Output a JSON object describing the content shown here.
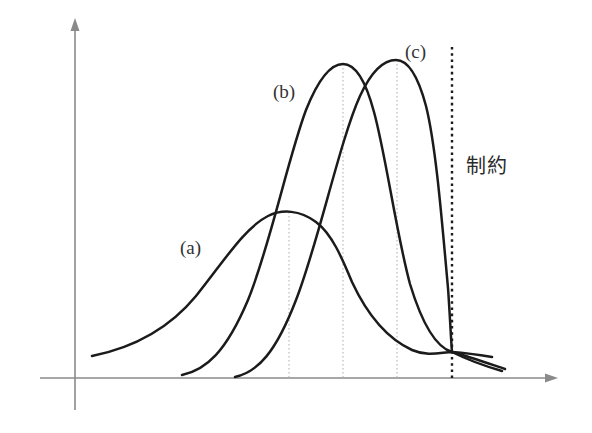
{
  "figure": {
    "title": "",
    "background_color": "#ffffff",
    "curve_color": "#1b1b1b",
    "axis_color": "#8a8a8a",
    "guide_color": "#b4b4b4"
  },
  "labels": {
    "curve_a": "(a)",
    "curve_b": "(b)",
    "curve_c": "(c)",
    "constraint": "制約"
  },
  "axes": {
    "x_axis_name": "x-axis-arrow",
    "y_axis_name": "y-axis-arrow",
    "x_axis_y": 378,
    "y_axis_x": 75
  },
  "chart_data": {
    "type": "line",
    "title": "",
    "xlabel": "",
    "ylabel": "",
    "grid": true,
    "legend_position": "inline-annotations",
    "annotations": [
      {
        "text": "(a)",
        "x": 180,
        "y": 238
      },
      {
        "text": "(b)",
        "x": 273,
        "y": 82
      },
      {
        "text": "(c)",
        "x": 405,
        "y": 42
      },
      {
        "text": "制約",
        "x": 466,
        "y": 156
      }
    ],
    "guide_lines": [
      {
        "name": "peak-a-guide",
        "x": 289,
        "style": "dotted"
      },
      {
        "name": "peak-b-guide",
        "x": 343,
        "style": "dotted"
      },
      {
        "name": "peak-c-guide",
        "x": 397,
        "style": "dotted"
      },
      {
        "name": "constraint-line",
        "x": 452,
        "style": "dashed-bold"
      }
    ],
    "series": [
      {
        "name": "(a)",
        "peak_x": 289,
        "peak_y": 212,
        "start_x": 92,
        "start_y": 356,
        "end_x": 492,
        "end_y": 357,
        "path": "M92,356 C132,348 168,330 196,296 C222,264 244,228 268,216 C282,209 300,210 316,222 C332,234 342,258 352,282 C366,312 386,338 412,350 C428,357 442,352 452,352 C466,353 480,355 492,357"
      },
      {
        "name": "(b)",
        "peak_x": 343,
        "peak_y": 64,
        "start_x": 182,
        "start_y": 375,
        "end_x": 505,
        "end_y": 369,
        "path": "M182,375 C206,370 226,352 248,300 C270,246 288,158 306,110 C318,80 330,64 343,64 C356,64 366,82 374,112 C386,156 396,232 410,284 C424,330 438,348 452,352 C470,357 490,364 505,369"
      },
      {
        "name": "(c)",
        "peak_x": 396,
        "peak_y": 60,
        "start_x": 235,
        "start_y": 377,
        "end_x": 502,
        "end_y": 371,
        "path": "M235,377 C258,372 276,352 296,300 C318,244 340,140 360,96 C372,70 384,60 396,60 C408,60 418,76 426,106 C436,146 442,222 448,288 C450,316 451,340 452,352 C468,360 488,367 502,371"
      }
    ]
  }
}
